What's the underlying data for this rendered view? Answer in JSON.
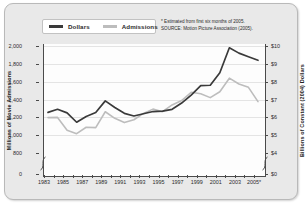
{
  "legend": {
    "items": [
      {
        "label": "Dollars",
        "color": "#3a3a3a",
        "swatch": "dark"
      },
      {
        "label": "Admissions",
        "color": "#bdbdbd",
        "swatch": "light"
      }
    ]
  },
  "notes": [
    "* Estimated from first six months of 2005.",
    "SOURCE: Motion Picture Association  (2005)."
  ],
  "axes": {
    "left": {
      "title": "Millions of Movie Admissions",
      "ticks": [
        "2,000",
        "1,800",
        "1,600",
        "1,400",
        "1,200",
        "1,000",
        "800",
        "0"
      ]
    },
    "right": {
      "title": "Billions of Constant (2004) Dollars",
      "ticks": [
        "$10",
        "$9",
        "$8",
        "$7",
        "$6",
        "$5",
        "$4",
        "$0"
      ]
    },
    "bottom": {
      "labels": [
        "1983",
        "1985",
        "1987",
        "1989",
        "1991",
        "1993",
        "1995",
        "1997",
        "1999",
        "2001",
        "2003",
        "2005*"
      ]
    }
  },
  "chart_data": {
    "type": "line",
    "title": "",
    "xlabel": "",
    "ylabel": "Millions of Movie Admissions",
    "y2label": "Billions of Constant (2004) Dollars",
    "grid": true,
    "legend_position": "top-left",
    "x": [
      1983,
      1984,
      1985,
      1986,
      1987,
      1988,
      1989,
      1990,
      1991,
      1992,
      1993,
      1994,
      1995,
      1996,
      1997,
      1998,
      1999,
      2000,
      2001,
      2002,
      2003,
      2004,
      2005
    ],
    "xtick_labels": [
      "1983",
      "",
      "1985",
      "",
      "1987",
      "",
      "1989",
      "",
      "1991",
      "",
      "1993",
      "",
      "1995",
      "",
      "1997",
      "",
      "1999",
      "",
      "2001",
      "",
      "2003",
      "",
      "2005*"
    ],
    "ylim": [
      800,
      2000
    ],
    "yticks": [
      800,
      1000,
      1200,
      1400,
      1600,
      1800,
      2000
    ],
    "y2lim": [
      4,
      10
    ],
    "y2ticks": [
      4,
      5,
      6,
      7,
      8,
      9,
      10
    ],
    "axis_break": true,
    "series": [
      {
        "name": "Dollars",
        "axis": "right",
        "color": "#3a3a3a",
        "units": "Billions of Constant (2004) Dollars",
        "values": [
          6.28,
          6.45,
          6.25,
          5.73,
          6.05,
          6.27,
          6.93,
          6.55,
          6.23,
          6.08,
          6.2,
          6.33,
          6.35,
          6.45,
          6.8,
          7.25,
          7.78,
          7.8,
          8.5,
          9.9,
          9.6,
          9.4,
          9.2
        ]
      },
      {
        "name": "Admissions",
        "axis": "left",
        "color": "#bdbdbd",
        "units": "Millions of Movie Admissions",
        "values": [
          1197,
          1199,
          1056,
          1017,
          1089,
          1085,
          1263,
          1189,
          1141,
          1173,
          1244,
          1292,
          1263,
          1339,
          1388,
          1481,
          1465,
          1421,
          1487,
          1639,
          1574,
          1536,
          1376
        ]
      }
    ],
    "series_plotted_on_left_scale": [
      {
        "name": "Dollars",
        "values_mapped_to_left_axis": [
          1255,
          1290,
          1250,
          1145,
          1210,
          1255,
          1385,
          1310,
          1245,
          1215,
          1240,
          1265,
          1270,
          1290,
          1360,
          1450,
          1555,
          1560,
          1700,
          1980,
          1920,
          1880,
          1840
        ]
      }
    ],
    "annotations": [
      "* Estimated from first six months of 2005.",
      "SOURCE: Motion Picture Association  (2005)."
    ]
  }
}
